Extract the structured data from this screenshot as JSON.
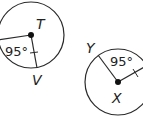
{
  "diagram": {
    "circle_left": {
      "center_label": "T",
      "point_label": "V",
      "angle_label": "95°"
    },
    "circle_right": {
      "center_label": "X",
      "point_label": "Y",
      "angle_label": "95°"
    },
    "colors": {
      "stroke": "#2a2a2a",
      "label": "#222222",
      "background": "#ffffff"
    }
  }
}
